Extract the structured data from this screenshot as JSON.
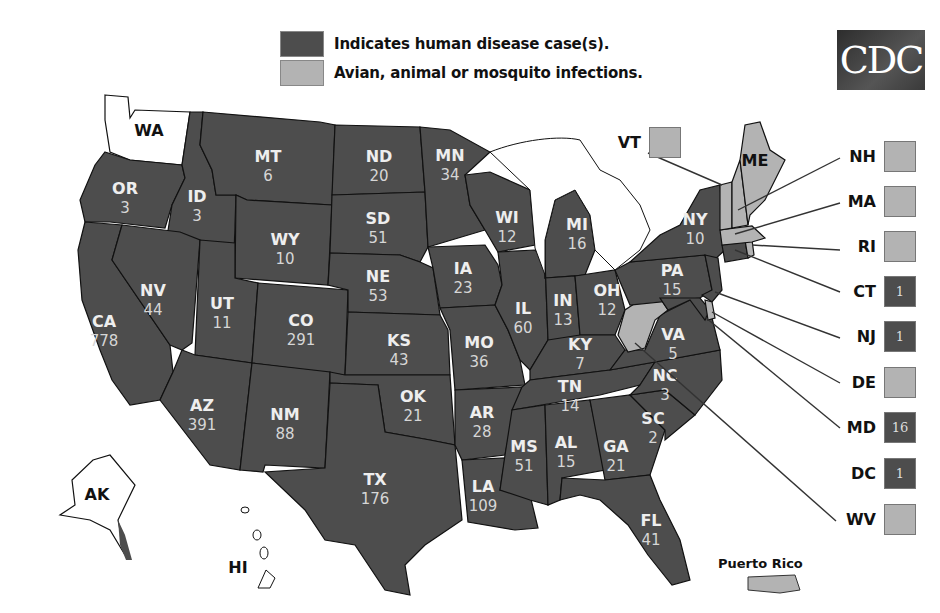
{
  "legend": {
    "human": {
      "label": "Indicates human disease case(s).",
      "color": "#4d4d4d"
    },
    "animal": {
      "label": "Avian, animal or mosquito infections.",
      "color": "#b3b3b3"
    }
  },
  "logo": {
    "text": "CDC"
  },
  "states": {
    "WA": {
      "abbr": "WA",
      "count": ""
    },
    "OR": {
      "abbr": "OR",
      "count": "3"
    },
    "CA": {
      "abbr": "CA",
      "count": "778"
    },
    "ID": {
      "abbr": "ID",
      "count": "3"
    },
    "NV": {
      "abbr": "NV",
      "count": "44"
    },
    "MT": {
      "abbr": "MT",
      "count": "6"
    },
    "WY": {
      "abbr": "WY",
      "count": "10"
    },
    "UT": {
      "abbr": "UT",
      "count": "11"
    },
    "AZ": {
      "abbr": "AZ",
      "count": "391"
    },
    "CO": {
      "abbr": "CO",
      "count": "291"
    },
    "NM": {
      "abbr": "NM",
      "count": "88"
    },
    "ND": {
      "abbr": "ND",
      "count": "20"
    },
    "SD": {
      "abbr": "SD",
      "count": "51"
    },
    "NE": {
      "abbr": "NE",
      "count": "53"
    },
    "KS": {
      "abbr": "KS",
      "count": "43"
    },
    "OK": {
      "abbr": "OK",
      "count": "21"
    },
    "TX": {
      "abbr": "TX",
      "count": "176"
    },
    "MN": {
      "abbr": "MN",
      "count": "34"
    },
    "IA": {
      "abbr": "IA",
      "count": "23"
    },
    "MO": {
      "abbr": "MO",
      "count": "36"
    },
    "AR": {
      "abbr": "AR",
      "count": "28"
    },
    "LA": {
      "abbr": "LA",
      "count": "109"
    },
    "WI": {
      "abbr": "WI",
      "count": "12"
    },
    "IL": {
      "abbr": "IL",
      "count": "60"
    },
    "MI": {
      "abbr": "MI",
      "count": "16"
    },
    "IN": {
      "abbr": "IN",
      "count": "13"
    },
    "OH": {
      "abbr": "OH",
      "count": "12"
    },
    "KY": {
      "abbr": "KY",
      "count": "7"
    },
    "TN": {
      "abbr": "TN",
      "count": "14"
    },
    "MS": {
      "abbr": "MS",
      "count": "51"
    },
    "AL": {
      "abbr": "AL",
      "count": "15"
    },
    "GA": {
      "abbr": "GA",
      "count": "21"
    },
    "FL": {
      "abbr": "FL",
      "count": "41"
    },
    "SC": {
      "abbr": "SC",
      "count": "2"
    },
    "NC": {
      "abbr": "NC",
      "count": "3"
    },
    "VA": {
      "abbr": "VA",
      "count": "5"
    },
    "PA": {
      "abbr": "PA",
      "count": "15"
    },
    "NY": {
      "abbr": "NY",
      "count": "10"
    },
    "ME": {
      "abbr": "ME",
      "count": ""
    },
    "AK": {
      "abbr": "AK",
      "count": ""
    },
    "HI": {
      "abbr": "HI",
      "count": ""
    }
  },
  "callouts": {
    "VT": {
      "abbr": "VT",
      "count": "",
      "status": "animal"
    },
    "NH": {
      "abbr": "NH",
      "count": "",
      "status": "animal"
    },
    "MA": {
      "abbr": "MA",
      "count": "",
      "status": "animal"
    },
    "RI": {
      "abbr": "RI",
      "count": "",
      "status": "animal"
    },
    "CT": {
      "abbr": "CT",
      "count": "1",
      "status": "human"
    },
    "NJ": {
      "abbr": "NJ",
      "count": "1",
      "status": "human"
    },
    "DE": {
      "abbr": "DE",
      "count": "",
      "status": "animal"
    },
    "MD": {
      "abbr": "MD",
      "count": "16",
      "status": "human"
    },
    "DC": {
      "abbr": "DC",
      "count": "1",
      "status": "human"
    },
    "WV": {
      "abbr": "WV",
      "count": "",
      "status": "animal"
    }
  },
  "territories": {
    "PR": {
      "label": "Puerto Rico",
      "status": "animal"
    }
  }
}
